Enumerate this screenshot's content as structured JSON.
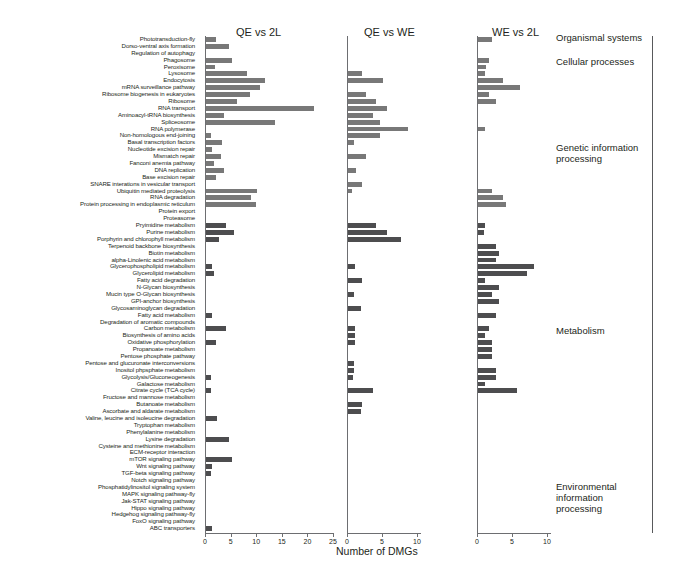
{
  "chart_data": {
    "type": "bar",
    "orientation": "horizontal",
    "title": "",
    "xlabel": "Number of DMGs",
    "ylabel": "",
    "grid": false,
    "legend": "none",
    "panels": [
      {
        "name": "QE vs 2L",
        "xlim": [
          0,
          25
        ],
        "xticks": [
          0,
          5,
          10,
          15,
          20,
          25
        ]
      },
      {
        "name": "QE vs WE",
        "xlim": [
          0,
          12
        ],
        "xticks": [
          0,
          5,
          10
        ]
      },
      {
        "name": "WE vs 2L",
        "xlim": [
          0,
          12
        ],
        "xticks": [
          0,
          5,
          10
        ]
      }
    ],
    "categories": [
      "Phototransduction-fly",
      "Dorso-ventral axis formation",
      "Regulation of autophagy",
      "Phagosome",
      "Peroxisome",
      "Lysosome",
      "Endocytosis",
      "mRNA surveillance pathway",
      "Ribosome biogenesis in eukaryotes",
      "Ribosome",
      "RNA transport",
      "Aminoacyl-tRNA biosynthesis",
      "Spliceosome",
      "RNA polymerase",
      "Non-homologous end-joining",
      "Basal transcription factors",
      "Nucleotide excision repair",
      "Mismatch repair",
      "Fanconi anemia pathway",
      "DNA replication",
      "Base excision repair",
      "SNARE interations in vesicular transport",
      "Ubiquitin mediated proteolysis",
      "RNA degradation",
      "Protein processing in endoplasmic reticulum",
      "Protein export",
      "Proteasome",
      "Pryimidine metabolism",
      "Purine metabolism",
      "Porphyrin and chlorophyll metabolism",
      "Terpenoid backbone biosynthesis",
      "Biotin metabolism",
      "alpha-Linolenic acid metabolism",
      "Glycerophospholipid metabolism",
      "Glycerolipid metabolism",
      "Fatty acid degradation",
      "N-Glycan biosynthesis",
      "Mucin type O-Glycan biosynthesis",
      "GPI-anchor biosynthesis",
      "Glycosaminoglycan degradation",
      "Fatty acid metabolism",
      "Degradation of aromatic compounds",
      "Carbon metabolism",
      "Biosynthesis of amino acids",
      "Oxidative phosphorylation",
      "Propanoate metabolism",
      "Pentose phosphate pathway",
      "Pentose and glucuronate interconversions",
      "Inositol phpsphate metabolism",
      "Glycolysis/Gluconeogenesis",
      "Galactose metabolism",
      "Citrate cycle (TCA cycle)",
      "Fructose and mannose metabolism",
      "Butanoate metabolism",
      "Ascorbate and aldarate metabolism",
      "Valine, leucine and isoleucine degradation",
      "Tryptophan metabolism",
      "Phenylalanine metabolism",
      "Lysine degradation",
      "Cysteine and methionine metabolism",
      "ECM-receptor interaction",
      "mTOR signaling pathway",
      "Wnt signaling pathway",
      "TGF-beta signaling pathway",
      "Notch signaling pathway",
      "Phosphatidylinositol signaling system",
      "MAPK signaling pathway-fly",
      "Jak-STAT signaling pathway",
      "Hippo signaling pathway",
      "Hedgehog signaling pathway-fly",
      "FoxO signaling pathway",
      "ABC transporters"
    ],
    "series": [
      {
        "name": "QE vs 2L",
        "panel": 0,
        "color": "#787878",
        "values": [
          2.0,
          4.5,
          0,
          5.0,
          1.8,
          8.0,
          11.5,
          10.5,
          8.5,
          6.0,
          21.0,
          3.5,
          13.5,
          0,
          1.0,
          3.2,
          1.2,
          3.0,
          1.5,
          3.5,
          2.0,
          0,
          10.0,
          8.8,
          9.8,
          0,
          0,
          4.0,
          5.5,
          2.5,
          0,
          0,
          0,
          1.2,
          1.5,
          0,
          0,
          0,
          0,
          0,
          1.2,
          0,
          4.0,
          0,
          2.0,
          0,
          0,
          0,
          0,
          1.0,
          0,
          1.0,
          0,
          0,
          0,
          2.2,
          0,
          0,
          4.5,
          0,
          0,
          5.0,
          1.2,
          1.0,
          0,
          0,
          0,
          0,
          0,
          0,
          0,
          1.2
        ]
      },
      {
        "name": "QE vs WE",
        "panel": 1,
        "color": "#787878",
        "values": [
          0,
          0,
          0,
          0,
          0,
          2.0,
          5.0,
          0,
          2.5,
          4.0,
          5.5,
          3.5,
          4.5,
          8.5,
          4.5,
          0.8,
          0,
          2.5,
          0,
          1.2,
          0,
          2.0,
          0.6,
          0,
          0,
          0,
          0,
          4.0,
          5.5,
          7.5,
          0,
          0,
          0,
          1.0,
          0,
          2.0,
          0,
          0.8,
          0,
          1.8,
          0,
          0,
          1.0,
          1.0,
          1.0,
          0,
          0,
          0.8,
          0.8,
          0.7,
          0,
          3.5,
          0,
          2.0,
          1.8,
          0,
          0,
          0,
          0,
          0,
          0,
          0,
          0,
          0,
          0,
          0,
          0,
          0,
          0,
          0,
          0,
          0
        ]
      },
      {
        "name": "WE vs 2L",
        "panel": 2,
        "color": "#787878",
        "values": [
          2.0,
          0,
          0,
          1.5,
          1.2,
          1.0,
          3.5,
          6.0,
          1.5,
          2.5,
          0,
          0,
          0,
          1.0,
          0,
          0,
          0,
          0,
          0,
          0,
          0,
          0,
          2.0,
          3.5,
          4.0,
          0,
          0,
          1.0,
          0.8,
          0,
          2.5,
          3.0,
          2.5,
          8.0,
          7.0,
          1.0,
          3.0,
          2.0,
          3.0,
          0,
          2.5,
          0,
          1.5,
          1.0,
          2.0,
          2.0,
          2.0,
          0,
          2.5,
          2.5,
          1.0,
          5.5,
          0,
          0,
          0,
          0,
          0,
          0,
          0,
          0,
          0,
          0,
          0,
          0,
          0,
          0,
          0,
          0,
          0,
          0,
          0,
          0
        ]
      }
    ],
    "row_groups": [
      {
        "label": "Organismal systems",
        "start": 0,
        "end": 1
      },
      {
        "label": "Cellular processes",
        "start": 2,
        "end": 6
      },
      {
        "label": "Genetic information processing",
        "start": 7,
        "end": 26
      },
      {
        "label": "Metabolism",
        "start": 27,
        "end": 59
      },
      {
        "label": "Environmental information processing",
        "start": 60,
        "end": 71
      }
    ]
  },
  "axis": {
    "xtitle": "Number of DMGs"
  },
  "colors": {
    "bar_light": "#787878",
    "bar_dark": "#4d4d4f",
    "axis": "#6d6e71",
    "text": "#231f20"
  }
}
